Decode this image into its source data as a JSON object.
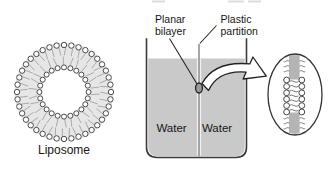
{
  "diagram": {
    "liposome": {
      "label": "Liposome"
    },
    "chamber": {
      "water_left": "Water",
      "water_right": "Water"
    },
    "annotations": {
      "planar_bilayer": {
        "line1": "Planar",
        "line2": "bilayer"
      },
      "plastic_partition": {
        "line1": "Plastic",
        "line2": "partition"
      }
    },
    "colors": {
      "water": "#c9c9c9",
      "liposome_ring": "#e6e6e6",
      "partition_band": "#b4b4b4",
      "outline": "#3a3a3a",
      "partition_line": "#8a8a8a",
      "text": "#161616"
    }
  }
}
